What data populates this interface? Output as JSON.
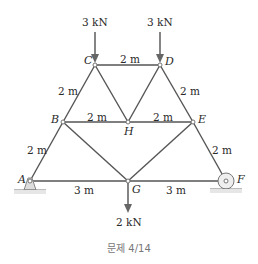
{
  "diagram": {
    "title_caption": "문제 4/14",
    "nodes": {
      "A": "A",
      "B": "B",
      "C": "C",
      "D": "D",
      "E": "E",
      "F": "F",
      "G": "G",
      "H": "H"
    },
    "dimensions": {
      "CD": "2 m",
      "BC": "2 m",
      "DE": "2 m",
      "BH": "2 m",
      "HE": "2 m",
      "AB": "2 m",
      "EF": "2 m",
      "AG": "3 m",
      "GF": "3 m"
    },
    "loads": {
      "C": "3 kN",
      "D": "3 kN",
      "G": "2 kN"
    },
    "colors": {
      "member": "#555555",
      "text": "#2a2a2a",
      "support": "#cccccc"
    }
  }
}
